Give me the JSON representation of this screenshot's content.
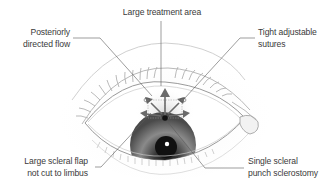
{
  "figure": {
    "colors": {
      "background": "#ffffff",
      "leader_line": "#5a5a5a",
      "label_text": "#3a3a3a",
      "lid_outline": "#9a9a9a",
      "iris_dark": "#2a2a2a",
      "iris_mid": "#7a7a7a",
      "arrow": "#707070"
    },
    "labels": {
      "top": {
        "text": "Large treatment area"
      },
      "top_left": {
        "line1": "Posteriorly",
        "line2": "directed flow"
      },
      "top_right": {
        "line1": "Tight adjustable",
        "line2": "sutures"
      },
      "bottom_left": {
        "line1": "Large scleral flap",
        "line2": "not cut to limbus"
      },
      "bottom_right": {
        "line1": "Single scleral",
        "line2": "punch sclerostomy"
      }
    }
  }
}
